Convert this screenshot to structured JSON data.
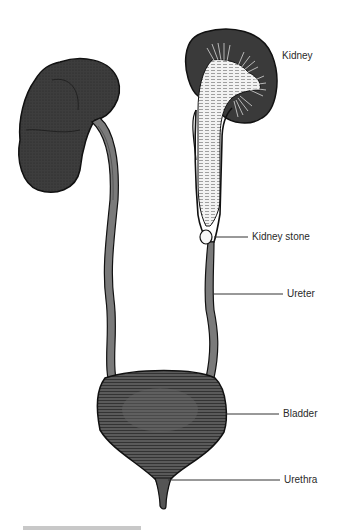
{
  "diagram": {
    "labels": [
      {
        "id": "kidney",
        "text": "Kidney"
      },
      {
        "id": "kidney_stone",
        "text": "Kidney stone"
      },
      {
        "id": "ureter",
        "text": "Ureter"
      },
      {
        "id": "bladder",
        "text": "Bladder"
      },
      {
        "id": "urethra",
        "text": "Urethra"
      }
    ],
    "colors": {
      "kidney_fill": "#3a3a3a",
      "ureter_fill": "#7a7a7a",
      "bladder_fill": "#555555",
      "inner_pelvis": "#f0f0f0",
      "outline": "#111111",
      "leader_line": "#333333",
      "label_text": "#2a2a2a"
    }
  }
}
